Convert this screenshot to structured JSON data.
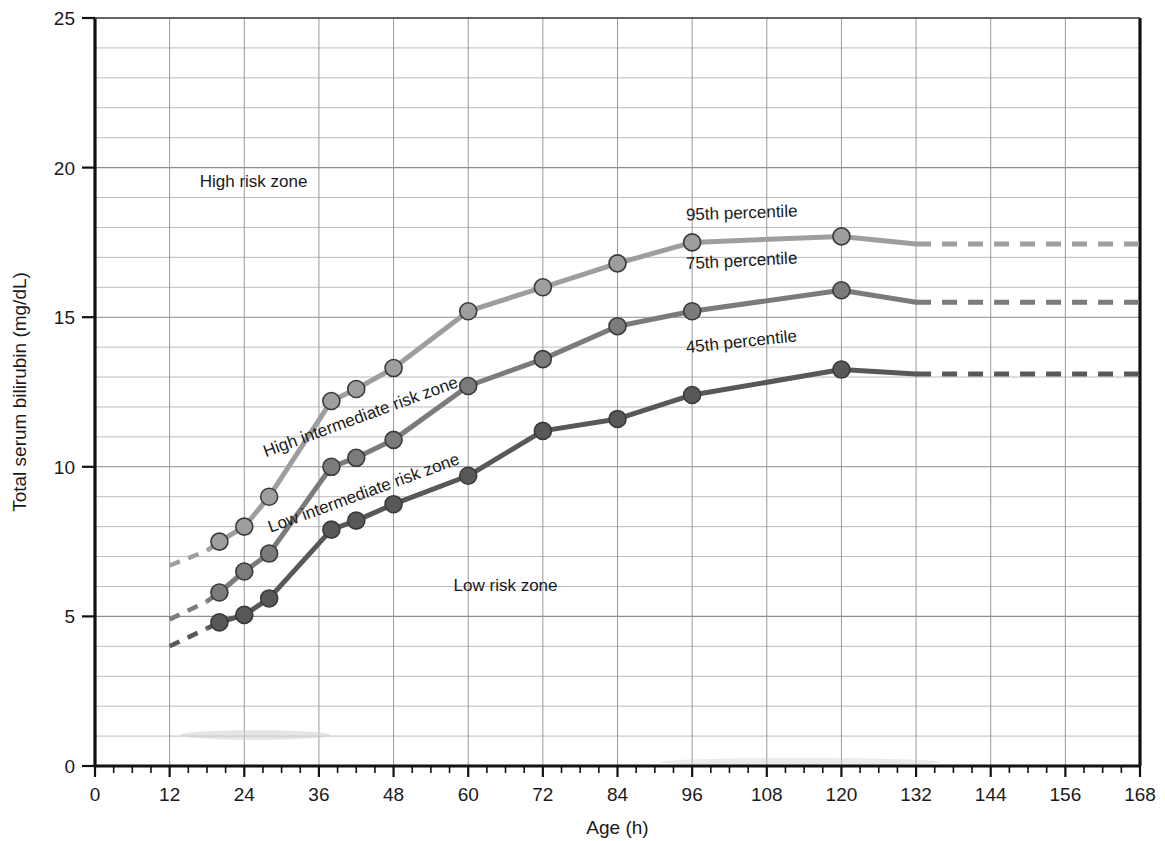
{
  "chart_data": {
    "type": "line",
    "title": "",
    "xlabel": "Age (h)",
    "ylabel": "Total serum bilirubin (mg/dL)",
    "xlim": [
      0,
      168
    ],
    "ylim": [
      0,
      25
    ],
    "x_ticks": [
      0,
      12,
      24,
      36,
      48,
      60,
      72,
      84,
      96,
      108,
      120,
      132,
      144,
      156,
      168
    ],
    "x_tick_labels": [
      "0",
      "12",
      "24",
      "36",
      "48",
      "60",
      "72",
      "84",
      "96",
      "108",
      "120",
      "132",
      "144",
      "156",
      "168"
    ],
    "x_minor_tick_step": 3,
    "y_ticks": [
      0,
      5,
      10,
      15,
      20,
      25
    ],
    "y_tick_labels": [
      "0",
      "5",
      "10",
      "15",
      "20",
      "25"
    ],
    "y_gridline_step": 1,
    "grid": true,
    "legend_position": "inline-curve-labels",
    "series": [
      {
        "name": "95th percentile",
        "color": "#9e9e9e",
        "label": "95th percentile",
        "label_x": 104,
        "label_y": 18.3,
        "label_rotation": -2,
        "dashed_lead_in": [
          {
            "x": 12,
            "y": 6.7
          },
          {
            "x": 18,
            "y": 7.2
          }
        ],
        "points": [
          {
            "x": 20,
            "y": 7.5
          },
          {
            "x": 24,
            "y": 8.0
          },
          {
            "x": 28,
            "y": 9.0
          },
          {
            "x": 38,
            "y": 12.2
          },
          {
            "x": 42,
            "y": 12.6
          },
          {
            "x": 48,
            "y": 13.3
          },
          {
            "x": 60,
            "y": 15.2
          },
          {
            "x": 72,
            "y": 16.0
          },
          {
            "x": 84,
            "y": 16.8
          },
          {
            "x": 96,
            "y": 17.5
          },
          {
            "x": 120,
            "y": 17.7
          }
        ],
        "tail_solid": [
          {
            "x": 120,
            "y": 17.7
          },
          {
            "x": 132,
            "y": 17.45
          }
        ],
        "dashed_tail": [
          {
            "x": 132,
            "y": 17.45
          },
          {
            "x": 168,
            "y": 17.45
          }
        ]
      },
      {
        "name": "75th percentile",
        "color": "#7b7b7b",
        "label": "75th percentile",
        "label_x": 104,
        "label_y": 16.7,
        "label_rotation": -3,
        "dashed_lead_in": [
          {
            "x": 12,
            "y": 4.9
          },
          {
            "x": 18,
            "y": 5.5
          }
        ],
        "points": [
          {
            "x": 20,
            "y": 5.8
          },
          {
            "x": 24,
            "y": 6.5
          },
          {
            "x": 28,
            "y": 7.1
          },
          {
            "x": 38,
            "y": 10.0
          },
          {
            "x": 42,
            "y": 10.3
          },
          {
            "x": 48,
            "y": 10.9
          },
          {
            "x": 60,
            "y": 12.7
          },
          {
            "x": 72,
            "y": 13.6
          },
          {
            "x": 84,
            "y": 14.7
          },
          {
            "x": 96,
            "y": 15.2
          },
          {
            "x": 120,
            "y": 15.9
          }
        ],
        "tail_solid": [
          {
            "x": 120,
            "y": 15.9
          },
          {
            "x": 132,
            "y": 15.5
          }
        ],
        "dashed_tail": [
          {
            "x": 132,
            "y": 15.5
          },
          {
            "x": 168,
            "y": 15.5
          }
        ]
      },
      {
        "name": "45th percentile",
        "color": "#585858",
        "label": "45th percentile",
        "label_x": 104,
        "label_y": 14.0,
        "label_rotation": -6,
        "dashed_lead_in": [
          {
            "x": 12,
            "y": 4.0
          },
          {
            "x": 18,
            "y": 4.6
          }
        ],
        "points": [
          {
            "x": 20,
            "y": 4.8
          },
          {
            "x": 24,
            "y": 5.05
          },
          {
            "x": 28,
            "y": 5.6
          },
          {
            "x": 38,
            "y": 7.9
          },
          {
            "x": 42,
            "y": 8.2
          },
          {
            "x": 48,
            "y": 8.75
          },
          {
            "x": 60,
            "y": 9.7
          },
          {
            "x": 72,
            "y": 11.2
          },
          {
            "x": 84,
            "y": 11.6
          },
          {
            "x": 96,
            "y": 12.4
          },
          {
            "x": 120,
            "y": 13.25
          }
        ],
        "tail_solid": [
          {
            "x": 120,
            "y": 13.25
          },
          {
            "x": 132,
            "y": 13.1
          }
        ],
        "dashed_tail": [
          {
            "x": 132,
            "y": 13.1
          },
          {
            "x": 168,
            "y": 13.1
          }
        ]
      }
    ],
    "annotations": [
      {
        "id": "high-risk-zone",
        "text": "High risk zone",
        "x": 25.5,
        "y": 19.35,
        "rotation": 0
      },
      {
        "id": "high-intermediate-risk-zone",
        "text": "High intermediate risk zone",
        "x": 43,
        "y": 11.5,
        "rotation": -20
      },
      {
        "id": "low-intermediate-risk-zone",
        "text": "Low intermediate risk zone",
        "x": 43.5,
        "y": 8.95,
        "rotation": -20
      },
      {
        "id": "low-risk-zone",
        "text": "Low risk zone",
        "x": 66,
        "y": 5.85,
        "rotation": 0
      }
    ]
  }
}
